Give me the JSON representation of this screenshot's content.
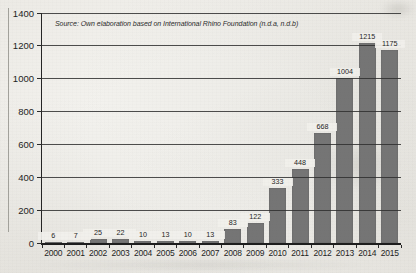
{
  "figure": {
    "source_note": "Source: Own elaboration based on International Rhino Foundation (n.d.a, n.d.b)"
  },
  "chart_data": {
    "type": "bar",
    "title": "",
    "xlabel": "",
    "ylabel": "",
    "source_note": "Source: Own elaboration based on International Rhino Foundation (n.d.a, n.d.b)",
    "categories": [
      "2000",
      "2001",
      "2002",
      "2003",
      "2004",
      "2005",
      "2006",
      "2007",
      "2008",
      "2009",
      "2010",
      "2011",
      "2012",
      "2013",
      "2014",
      "2015"
    ],
    "values": [
      6,
      7,
      25,
      22,
      10,
      13,
      10,
      13,
      83,
      122,
      333,
      448,
      668,
      1004,
      1215,
      1175
    ],
    "data_labels": true,
    "ylim": [
      0,
      1400
    ],
    "yticks": [
      0,
      200,
      400,
      600,
      800,
      1000,
      1200,
      1400
    ],
    "grid": true,
    "legend": false,
    "bar_color": "#757575",
    "gridline_color": "#2f2f2f",
    "paper_color": "#f0efeb",
    "text_color": "#1e1e1e"
  }
}
